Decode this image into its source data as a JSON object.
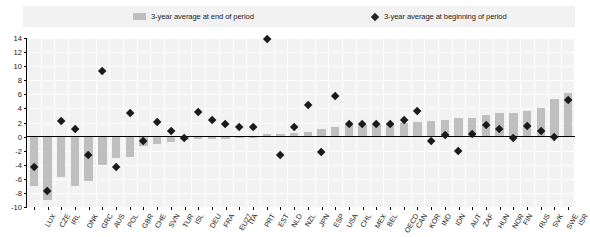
{
  "legend": {
    "bars": {
      "label": "3-year average at end of period",
      "icon": "bar-swatch-icon",
      "color": "#bfbfbf"
    },
    "diamonds": {
      "label": "3-year average at beginning of period",
      "icon": "diamond-marker-icon",
      "color": "#262626"
    }
  },
  "chart_data": {
    "type": "bar",
    "title": "",
    "subtitle": "",
    "xlabel": "",
    "ylabel": "",
    "ylim": [
      -10,
      14
    ],
    "yticks": [
      -10,
      -8,
      -6,
      -4,
      -2,
      0,
      2,
      4,
      6,
      8,
      10,
      12,
      14
    ],
    "ytick_labels": [
      "-10",
      "-8",
      "-6",
      "-4",
      "-2",
      "0",
      "2",
      "4",
      "6",
      "8",
      "10",
      "12",
      "14"
    ],
    "grid": true,
    "legend_position": "top",
    "categories": [
      "LUX",
      "CZE",
      "IRL",
      "DNK",
      "GRC",
      "AUS",
      "POL",
      "GBR",
      "CHE",
      "SVN",
      "TUR",
      "ISL",
      "DEU",
      "FRA",
      "EU27",
      "ITA",
      "PRT",
      "EST",
      "NLD",
      "NZL",
      "JPN",
      "ESP",
      "USA",
      "CHL",
      "MEX",
      "BEL",
      "OECD",
      "CAN",
      "KOR",
      "IND",
      "IDN",
      "AUT",
      "ZAF",
      "HUN",
      "NOR",
      "FIN",
      "RUS",
      "SVK",
      "SWE",
      "ISR"
    ],
    "series": [
      {
        "name": "3-year average at end of period",
        "type": "bar",
        "color": "#bfbfbf",
        "values": [
          -7.0,
          -9.0,
          -5.8,
          -7.0,
          -6.3,
          -4.0,
          -3.1,
          -2.9,
          -1.3,
          -1.1,
          -0.8,
          -0.5,
          -0.4,
          -0.3,
          -0.3,
          -0.2,
          -0.1,
          0.3,
          0.4,
          0.5,
          0.7,
          1.1,
          1.3,
          1.6,
          1.7,
          1.8,
          1.9,
          2.0,
          2.1,
          2.2,
          2.3,
          2.6,
          2.7,
          3.1,
          3.3,
          3.4,
          3.6,
          4.0,
          5.3,
          6.2
        ]
      },
      {
        "name": "3-year average at beginning of period",
        "type": "scatter",
        "color": "#1a1a1a",
        "marker": "diamond",
        "values": [
          -4.3,
          -7.8,
          2.2,
          1.1,
          -2.6,
          9.3,
          -4.3,
          3.3,
          -0.7,
          2.0,
          0.8,
          -0.2,
          3.5,
          2.3,
          1.7,
          1.3,
          1.4,
          13.9,
          -2.7,
          1.3,
          4.4,
          -2.2,
          5.8,
          1.7,
          1.7,
          1.7,
          1.8,
          2.3,
          3.6,
          -0.6,
          0.2,
          -2.1,
          0.4,
          1.6,
          1.1,
          -0.3,
          1.5,
          0.8,
          -0.1,
          5.2
        ]
      }
    ]
  }
}
